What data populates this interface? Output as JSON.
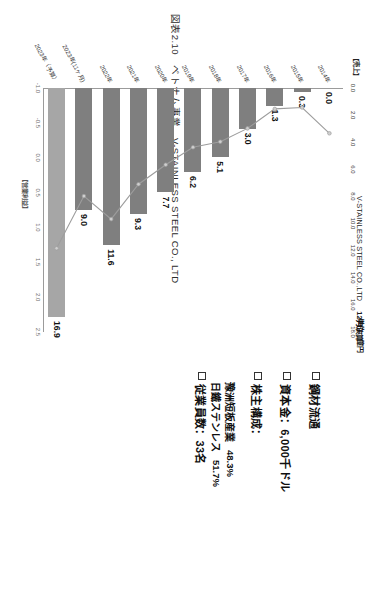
{
  "figure": {
    "caption": "図表2.10　ベトナム事業　V-STAINLESS STEEL CO., LTD"
  },
  "chart_header": {
    "company": "V-STAINLESS STEEL CO.,LTD",
    "fiscal": "12月決算",
    "unit": "単位：億円"
  },
  "axes": {
    "top_axis_title": "【売上】",
    "bottom_axis_title": "【営業利益】",
    "top_ticks": [
      "0.0",
      "2.0",
      "4.0",
      "6.0",
      "8.0",
      "10.0",
      "12.0",
      "14.0",
      "16.0",
      "18.0"
    ],
    "bottom_ticks": [
      "-1.0",
      "-0.5",
      "0.0",
      "0.5",
      "1.0",
      "1.5",
      "2.0",
      "2.5"
    ]
  },
  "info": {
    "items": [
      {
        "label": "鋼材流通"
      },
      {
        "label": "資本金：6,000千ドル"
      },
      {
        "label": "株主構成：",
        "sub": [
          {
            "name": "豫洲短板産業",
            "pct": "48.3%"
          },
          {
            "name": "日鐵ステンレス",
            "pct": "51.7%"
          }
        ]
      },
      {
        "label": "従業員数：33名"
      }
    ]
  },
  "chart_data": {
    "type": "bar",
    "xlabel": "【売上】",
    "ylabel": "",
    "categories": [
      "2014年",
      "2015年",
      "2016年",
      "2017年",
      "2018年",
      "2019年",
      "2020年",
      "2021年",
      "2022年",
      "2023年(11ヶ月)",
      "2023年（予算）"
    ],
    "series": [
      {
        "name": "売上（億円）",
        "type": "bar",
        "values": [
          0.0,
          0.3,
          1.3,
          3.0,
          5.1,
          6.2,
          7.7,
          9.3,
          11.6,
          9.0,
          16.9
        ],
        "labels": [
          "0.0",
          "0.3",
          "1.3",
          "3.0",
          "5.1",
          "6.2",
          "7.7",
          "9.3",
          "11.6",
          "9.0",
          "16.9"
        ],
        "xlim": [
          0.0,
          18.0
        ]
      },
      {
        "name": "営業利益（億円）",
        "type": "line",
        "values": [
          -0.35,
          -0.72,
          -0.7,
          -0.42,
          -0.23,
          -0.15,
          0.1,
          0.38,
          0.88,
          0.55,
          1.3
        ],
        "xlim": [
          -1.0,
          2.5
        ]
      }
    ],
    "grid": false,
    "legend": "none"
  }
}
